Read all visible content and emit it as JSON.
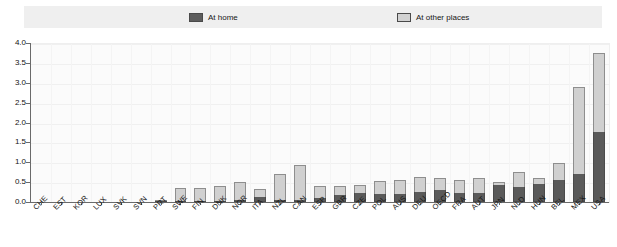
{
  "legend": {
    "entries": [
      {
        "label": "At home",
        "icon": "dark-swatch-icon",
        "color": "#5d5d5d"
      },
      {
        "label": "At other places",
        "icon": "light-swatch-icon",
        "color": "#d2d2d2"
      }
    ]
  },
  "axes": {
    "y_ticks": [
      "0.0",
      "0.5",
      "1.0",
      "1.5",
      "2.0",
      "2.5",
      "3.0",
      "3.5",
      "4.0"
    ],
    "y_min": 0.0,
    "y_max": 4.0,
    "y_step": 0.5
  },
  "chart_data": {
    "type": "bar",
    "stacked": true,
    "title": "",
    "subtitle": "",
    "xlabel": "",
    "ylabel": "",
    "ylim": [
      0.0,
      4.0
    ],
    "ytick_step": 0.5,
    "grid": true,
    "legend_position": "top",
    "categories": [
      "CHE",
      "EST",
      "KOR",
      "LUX",
      "SVK",
      "SVN",
      "PRT",
      "SWE",
      "FIN",
      "DNK",
      "NOR",
      "ITA",
      "NZL",
      "CAN",
      "ESP",
      "GBR",
      "CZE",
      "POL",
      "AUS",
      "DEU",
      "OECD",
      "FRA",
      "AUT",
      "JPN",
      "NLD",
      "HUN",
      "BEL",
      "MEX",
      "USA"
    ],
    "series": [
      {
        "name": "At home",
        "color": "#5a5a5a",
        "values": [
          0.0,
          0.0,
          0.0,
          0.0,
          0.0,
          0.0,
          0.02,
          0.03,
          0.03,
          0.03,
          0.04,
          0.12,
          0.06,
          0.06,
          0.1,
          0.18,
          0.22,
          0.2,
          0.2,
          0.25,
          0.3,
          0.22,
          0.22,
          0.42,
          0.38,
          0.45,
          0.55,
          0.7,
          1.75
        ]
      },
      {
        "name": "At other places",
        "color": "#d0d0d0",
        "values": [
          0.0,
          0.0,
          0.0,
          0.0,
          0.0,
          0.01,
          0.02,
          0.32,
          0.33,
          0.37,
          0.46,
          0.22,
          0.65,
          0.88,
          0.3,
          0.23,
          0.22,
          0.32,
          0.35,
          0.37,
          0.3,
          0.33,
          0.38,
          0.08,
          0.37,
          0.15,
          0.43,
          2.2,
          2.0
        ]
      }
    ],
    "totals": [
      0.0,
      0.0,
      0.0,
      0.0,
      0.0,
      0.01,
      0.04,
      0.35,
      0.36,
      0.4,
      0.5,
      0.34,
      0.71,
      0.94,
      0.4,
      0.41,
      0.44,
      0.52,
      0.55,
      0.62,
      0.6,
      0.55,
      0.6,
      0.5,
      0.75,
      0.6,
      0.98,
      2.9,
      3.75
    ]
  }
}
